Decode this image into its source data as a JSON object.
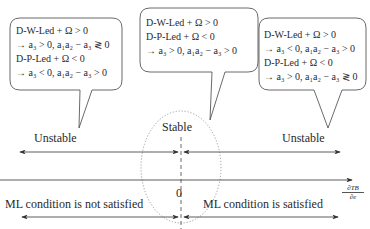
{
  "bubbles": {
    "left": {
      "line1": "D-W-Led + Ω > 0",
      "line2": "→ a₃ > 0, a₁a₂ − a₃ ≷ 0",
      "line3": "D-P-Led + Ω < 0",
      "line4": "→ a₃ < 0, a₁a₂ − a₃ > 0"
    },
    "center": {
      "line1": "D-W-Led + Ω > 0",
      "line2": "D-P-Led + Ω < 0",
      "line3": "→ a₃ > 0, a₁a₂ − a₃ > 0"
    },
    "right": {
      "line1": "D-W-Led + Ω > 0",
      "line2": "→ a₃ < 0, a₁a₂ − a₃ > 0",
      "line3": "D-P-Led + Ω < 0",
      "line4": "→ a₃ > 0, a₁a₂ − a₃ ≷ 0"
    }
  },
  "labels": {
    "stable": "Stable",
    "unstable_left": "Unstable",
    "unstable_right": "Unstable",
    "origin": "0",
    "axis_numerator": "∂TB",
    "axis_denominator": "∂e",
    "ml_not_satisfied": "ML condition is not satisfied",
    "ml_satisfied": "ML condition is satisfied"
  },
  "colors": {
    "line": "#333333",
    "dotted": "#888888"
  }
}
